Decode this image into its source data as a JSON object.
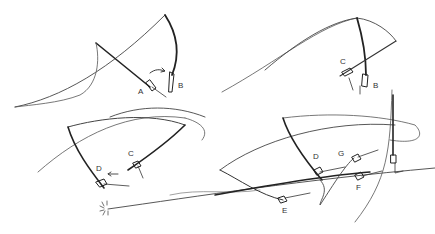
{
  "figure": {
    "stroke_color": "#2a2a2a",
    "line_color": "#6a6a6a",
    "background": "#ffffff"
  },
  "labels": {
    "A": "A",
    "B1": "B",
    "C1": "C",
    "B2": "B",
    "C2": "C",
    "D1": "D",
    "D2": "D",
    "G": "G",
    "F": "F",
    "E": "E"
  }
}
